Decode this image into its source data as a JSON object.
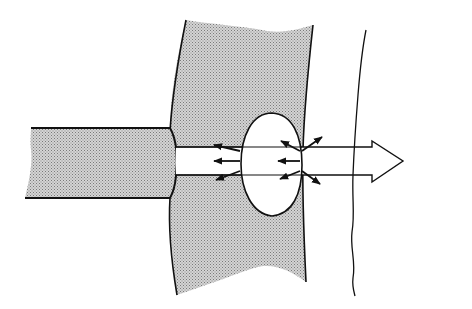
{
  "diagram": {
    "labels": [],
    "colors": {
      "background": "#ffffff",
      "stroke": "#111111",
      "stipple_fill": "#b8b8b8",
      "stipple_dot": "#7a7a7a",
      "beam_fill": "#ffffff"
    },
    "elements": {
      "fiber": {
        "name": "fiber-tip",
        "shaded": true
      },
      "tissue_layer": {
        "name": "tissue-layer",
        "shaded": true
      },
      "bubble": {
        "name": "vapor-bubble",
        "shape": "ellipse"
      },
      "beam": {
        "name": "beam-arrow",
        "direction": "right"
      },
      "boundary": {
        "name": "wavy-boundary-line"
      },
      "force_arrows_left_group": {
        "count": 3,
        "direction": "left"
      },
      "force_arrows_right_group": {
        "count": 5,
        "direction": "mixed"
      }
    }
  }
}
